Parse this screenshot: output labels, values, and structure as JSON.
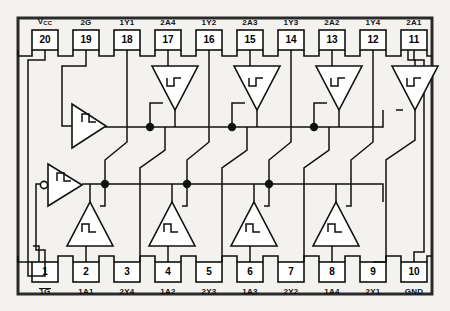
{
  "diagram": {
    "device_type": "octal-buffer-schmitt-trigger",
    "package_pins": 20,
    "colors": {
      "background": "#f4f2ef",
      "ink": "#111111",
      "frame": "#2a2a2a"
    },
    "geometry": {
      "frame": {
        "x": 18,
        "y": 18,
        "w": 414,
        "h": 276
      },
      "top_pin_y": 30,
      "bottom_pin_y": 262,
      "pin_box_w": 26,
      "pin_box_h": 20,
      "bus_top_y": 127,
      "bus_bottom_y": 184
    }
  },
  "pins": {
    "top": [
      {
        "number": "20",
        "label": "VCC",
        "label_main": "V",
        "label_sub": "CC",
        "x": 32
      },
      {
        "number": "19",
        "label": "2G",
        "x": 73
      },
      {
        "number": "18",
        "label": "1Y1",
        "x": 114
      },
      {
        "number": "17",
        "label": "2A4",
        "x": 155
      },
      {
        "number": "16",
        "label": "1Y2",
        "x": 196
      },
      {
        "number": "15",
        "label": "2A3",
        "x": 237
      },
      {
        "number": "14",
        "label": "1Y3",
        "x": 278
      },
      {
        "number": "13",
        "label": "2A2",
        "x": 319
      },
      {
        "number": "12",
        "label": "1Y4",
        "x": 360
      },
      {
        "number": "11",
        "label": "2A1",
        "x": 401
      }
    ],
    "bottom": [
      {
        "number": "1",
        "label": "1G",
        "overline": true,
        "x": 32
      },
      {
        "number": "2",
        "label": "1A1",
        "overline": false,
        "x": 73
      },
      {
        "number": "3",
        "label": "2Y4",
        "overline": false,
        "x": 114
      },
      {
        "number": "4",
        "label": "1A2",
        "overline": false,
        "x": 155
      },
      {
        "number": "5",
        "label": "2Y3",
        "overline": false,
        "x": 196
      },
      {
        "number": "6",
        "label": "1A3",
        "overline": false,
        "x": 237
      },
      {
        "number": "7",
        "label": "2Y2",
        "overline": false,
        "x": 278
      },
      {
        "number": "8",
        "label": "1A4",
        "overline": false,
        "x": 319
      },
      {
        "number": "9",
        "label": "2Y1",
        "overline": false,
        "x": 360
      },
      {
        "number": "10",
        "label": "GND",
        "overline": false,
        "x": 401
      }
    ]
  },
  "gates": {
    "enable_buffers": [
      {
        "name": "enable-buffer-2g",
        "orientation": "right",
        "cx": 88,
        "cy": 126,
        "bubble": false
      },
      {
        "name": "enable-buffer-1g",
        "orientation": "right",
        "cx": 62,
        "cy": 184,
        "bubble": true
      }
    ],
    "upper_inverters": [
      {
        "name": "schmitt-inverter-2a4",
        "cx": 175,
        "cy": 85
      },
      {
        "name": "schmitt-inverter-2a3",
        "cx": 257,
        "cy": 85
      },
      {
        "name": "schmitt-inverter-2a2",
        "cx": 339,
        "cy": 85
      },
      {
        "name": "schmitt-inverter-2a1",
        "cx": 415,
        "cy": 85
      }
    ],
    "lower_inverters": [
      {
        "name": "schmitt-inverter-1a1",
        "cx": 90,
        "cy": 228
      },
      {
        "name": "schmitt-inverter-1a2",
        "cx": 172,
        "cy": 228
      },
      {
        "name": "schmitt-inverter-1a3",
        "cx": 254,
        "cy": 228
      },
      {
        "name": "schmitt-inverter-1a4",
        "cx": 336,
        "cy": 228
      }
    ]
  },
  "junctions": {
    "top_bus_dots_x": [
      150,
      232,
      314
    ],
    "bottom_bus_dots_x": [
      105,
      187,
      269
    ],
    "bus_top_y": 127,
    "bus_bottom_y": 184
  }
}
